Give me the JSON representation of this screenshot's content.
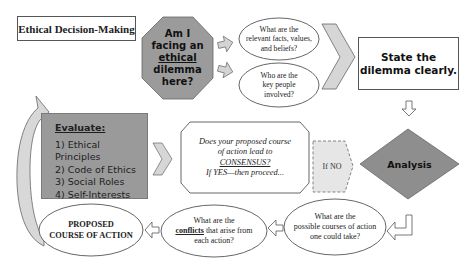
{
  "title": "Ethical Decision-Making",
  "octagon": {
    "lines": [
      "Am I",
      "facing an",
      "ethical",
      "dilemma",
      "here?"
    ],
    "underlined_word": "ethical",
    "fill": "#9b9b9b"
  },
  "questions_top": [
    {
      "lines": [
        "What are the",
        "relevant facts, values,",
        "and beliefs?"
      ]
    },
    {
      "lines": [
        "Who are the",
        "key people",
        "involved?"
      ]
    }
  ],
  "state_box": {
    "lines": [
      "State the",
      "dilemma clearly."
    ]
  },
  "analysis": {
    "label": "Analysis",
    "fill": "#8e8e8e"
  },
  "if_no": {
    "label": "If NO",
    "fill": "#e6e6e6"
  },
  "consensus_box": {
    "lines": [
      "Does your proposed course",
      "of action lead to",
      "CONSENSUS?",
      "If YES—then proceed..."
    ],
    "underlined_word": "CONSENSUS?"
  },
  "evaluate_box": {
    "heading": "Evaluate:",
    "items": [
      "1) Ethical Principles",
      "2) Code of Ethics",
      "3) Social Roles",
      "4) Self-Interests"
    ],
    "fill": "#9a9a9a"
  },
  "questions_bottom": [
    {
      "lines": [
        "What are the",
        "possible courses of action",
        "one could take?"
      ]
    },
    {
      "lines_pre": "What are the",
      "underlined_word": "conflicts",
      "line2_rest": " that arise from",
      "line3": "each action?"
    }
  ],
  "proposed": {
    "lines": [
      "PROPOSED",
      "COURSE OF ACTION"
    ]
  },
  "colors": {
    "arrow_fill": "#d4d4d4",
    "stroke": "#555555",
    "chevron_fill": "#d6d6d6"
  }
}
